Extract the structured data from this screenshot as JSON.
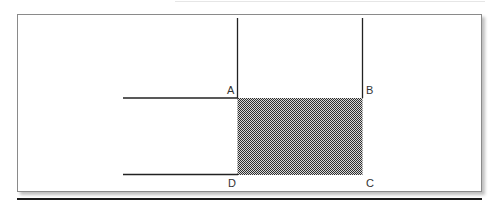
{
  "diagram": {
    "type": "geometry-figure",
    "labels": {
      "a": "A",
      "b": "B",
      "c": "C",
      "d": "D"
    },
    "shaded_region": {
      "corners": [
        "A",
        "B",
        "C",
        "D"
      ],
      "fill": "checkered-hatch",
      "color": "#555555"
    },
    "colors": {
      "line": "#222222",
      "frame_border": "#8a8a8a",
      "background": "#ffffff",
      "bottom_rule": "#1a1a1a"
    }
  }
}
